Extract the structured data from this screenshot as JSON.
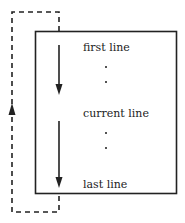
{
  "diagram": {
    "labels": {
      "first": "first line",
      "current": "current line",
      "last": "last line"
    },
    "colors": {
      "stroke": "#222222",
      "background": "#ffffff"
    },
    "elements": {
      "box": "text buffer rectangle",
      "arrow_first_to_current": "solid down arrow",
      "arrow_current_to_last": "solid down arrow",
      "wrap_loop": "dashed loop with up arrow from last line back to first line"
    }
  }
}
